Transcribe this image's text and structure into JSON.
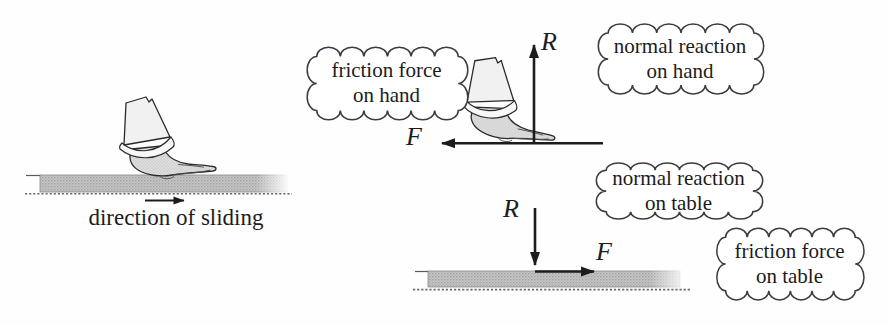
{
  "figure": {
    "left_scene": {
      "caption": "direction of sliding"
    },
    "hand_force_diagram": {
      "r_label": "R",
      "f_label": "F"
    },
    "table_force_diagram": {
      "r_label": "R",
      "f_label": "F"
    },
    "bubbles": {
      "friction_hand": {
        "line1": "friction force",
        "line2": "on hand"
      },
      "normal_hand": {
        "line1": "normal reaction",
        "line2": "on hand"
      },
      "normal_table": {
        "line1": "normal reaction",
        "line2": "on table"
      },
      "friction_table": {
        "line1": "friction force",
        "line2": "on table"
      }
    },
    "colors": {
      "ink": "#1c1c1c",
      "table_gray": "#c6c6c6",
      "cloud_stroke": "#3c3c3c"
    }
  }
}
